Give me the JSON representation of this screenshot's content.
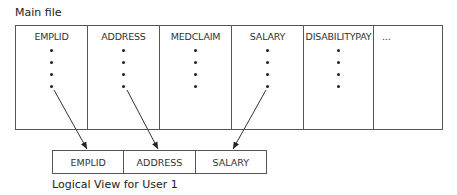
{
  "main_file": {
    "title": "Main file",
    "columns": [
      {
        "label": "EMPLID",
        "dots": 4
      },
      {
        "label": "ADDRESS",
        "dots": 4
      },
      {
        "label": "MEDCLAIM",
        "dots": 4
      },
      {
        "label": "SALARY",
        "dots": 4
      },
      {
        "label": "DISABILITYPAY",
        "dots": 4
      },
      {
        "label": "...",
        "dots": 0
      }
    ]
  },
  "logical_view": {
    "title": "Logical View for User 1",
    "columns": [
      {
        "label": "EMPLID"
      },
      {
        "label": "ADDRESS"
      },
      {
        "label": "SALARY"
      }
    ]
  },
  "colors": {
    "line": "#555555",
    "text": "#222222"
  }
}
